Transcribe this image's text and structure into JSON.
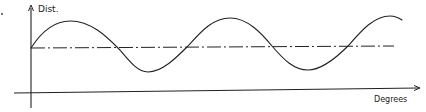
{
  "figure": {
    "y_axis_label": "Dist.",
    "x_axis_label": "Degrees",
    "colors": {
      "ink": "#222222",
      "background": "#ffffff"
    }
  },
  "geometry": {
    "y_axis_x": 31,
    "y_axis_top": 6,
    "y_axis_bottom": 108,
    "x_axis_y": 93,
    "x_axis_left": 14,
    "x_axis_right": 420,
    "x_axis_arrow_y": 88,
    "midline_y": 48,
    "midline_left": 31,
    "midline_right": 394,
    "wave": {
      "start": [
        31,
        48
      ],
      "peaks": [
        [
          70,
          21
        ],
        [
          230,
          18
        ],
        [
          390,
          16
        ]
      ],
      "troughs": [
        [
          148,
          72
        ],
        [
          308,
          70
        ]
      ],
      "end": [
        402,
        20
      ]
    }
  }
}
